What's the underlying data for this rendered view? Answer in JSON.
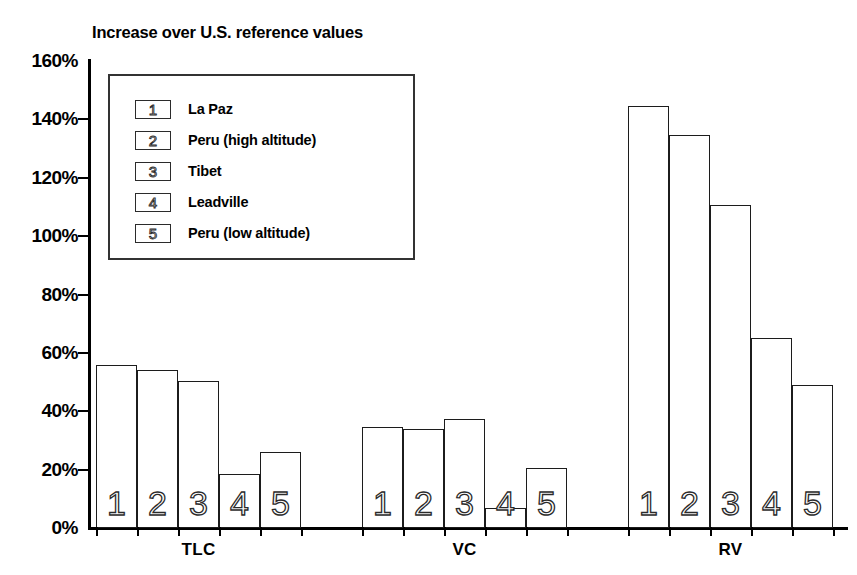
{
  "chart_data": {
    "type": "bar",
    "title": "Increase over U.S. reference values",
    "xlabel": "",
    "ylabel": "",
    "ylim": [
      0,
      160
    ],
    "ytick_labels": [
      "160%",
      "140%",
      "120%",
      "100%",
      "80%",
      "60%",
      "40%",
      "20%",
      "0%"
    ],
    "ytick_values": [
      160,
      140,
      120,
      100,
      80,
      60,
      40,
      20,
      0
    ],
    "grid": false,
    "legend_position": "upper-left-inside",
    "categories": [
      "TLC",
      "VC",
      "RV"
    ],
    "series": [
      {
        "key": "1",
        "name": "La Paz",
        "values": [
          56,
          34.5,
          144.5
        ]
      },
      {
        "key": "2",
        "name": "Peru (high altitude)",
        "values": [
          54,
          34,
          134.5
        ]
      },
      {
        "key": "3",
        "name": "Tibet",
        "values": [
          50.5,
          37.5,
          110.5
        ]
      },
      {
        "key": "4",
        "name": "Leadville",
        "values": [
          18.5,
          7,
          65
        ]
      },
      {
        "key": "5",
        "name": "Peru (low altitude)",
        "values": [
          26,
          20.5,
          49
        ]
      }
    ],
    "bar_labels": [
      "1",
      "2",
      "3",
      "4",
      "5"
    ]
  },
  "legend": {
    "entries": [
      {
        "key": "1",
        "label": "La Paz"
      },
      {
        "key": "2",
        "label": "Peru (high altitude)"
      },
      {
        "key": "3",
        "label": "Tibet"
      },
      {
        "key": "4",
        "label": "Leadville"
      },
      {
        "key": "5",
        "label": "Peru (low altitude)"
      }
    ]
  }
}
